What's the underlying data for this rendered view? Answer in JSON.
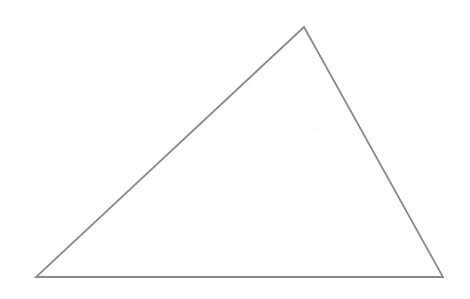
{
  "figure": {
    "kind": "line-drawing",
    "shape_name": "triangle",
    "canvas": {
      "width": 470,
      "height": 299,
      "background": "#ffffff"
    },
    "stroke": {
      "color": "#8a8a8a",
      "width": 1.8,
      "linejoin": "miter",
      "linecap": "round"
    },
    "fill": "none",
    "vertices": [
      {
        "name": "apex",
        "x": 304,
        "y": 27
      },
      {
        "name": "bottom-right",
        "x": 443,
        "y": 277
      },
      {
        "name": "bottom-left",
        "x": 36,
        "y": 277
      }
    ],
    "points_attr": "304,27 443,277 36,277",
    "edges": [
      {
        "name": "left-edge",
        "from": "bottom-left",
        "to": "apex"
      },
      {
        "name": "right-edge",
        "from": "apex",
        "to": "bottom-right"
      },
      {
        "name": "base-edge",
        "from": "bottom-left",
        "to": "bottom-right"
      }
    ],
    "marks": [
      {
        "name": "faint-smudge",
        "x": 312,
        "y": 128,
        "color": "#fbfbfb"
      }
    ]
  }
}
